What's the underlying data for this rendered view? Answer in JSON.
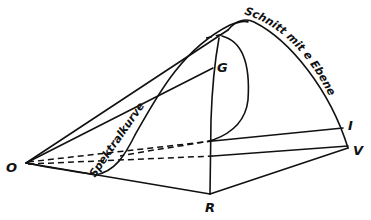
{
  "diagram": {
    "type": "geometric-construction",
    "points": {
      "O": {
        "label": "O",
        "x": 26,
        "y": 163
      },
      "G": {
        "label": "G",
        "x": 213,
        "y": 68
      },
      "R": {
        "label": "R",
        "x": 210,
        "y": 194
      },
      "V": {
        "label": "V",
        "x": 350,
        "y": 148
      },
      "I": {
        "label": "I",
        "x": 345,
        "y": 126
      }
    },
    "curve_labels": {
      "spectral_curve": "Spektralkurve",
      "plane_intersection": "Schnitt mit e Ebene"
    },
    "colors": {
      "ink": "#111111",
      "background": "#ffffff"
    }
  }
}
